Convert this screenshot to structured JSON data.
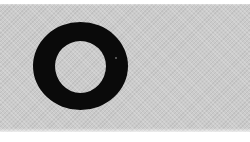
{
  "image": {
    "kind": "scanned symbol on gray halftone swatch",
    "symbol": {
      "glyph": "O",
      "shape": "ring",
      "icon": "ring-icon",
      "color": "#0a0a0a"
    },
    "background": {
      "swatch_color": "#cbcbcb",
      "page_color": "#ffffff"
    }
  }
}
